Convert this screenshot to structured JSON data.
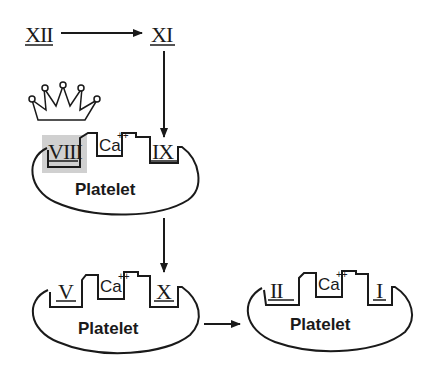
{
  "diagram": {
    "factors": {
      "xii": "XII",
      "xi": "XI",
      "viii": "VIII",
      "ix": "IX",
      "v": "V",
      "x": "X",
      "ii": "II",
      "i": "I"
    },
    "calcium": "Ca",
    "calcium_charge": "++",
    "platelet_label": "Platelet",
    "highlight_color": "#d0d0d0",
    "ink_color": "#1a1a1a"
  }
}
